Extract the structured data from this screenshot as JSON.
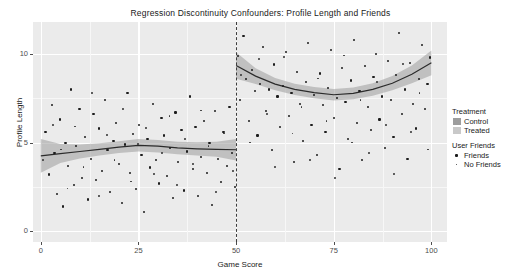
{
  "chart_data": {
    "type": "scatter",
    "title": "Regression Discontinuity Confounders: Profile Length and Friends",
    "xlabel": "Game Score",
    "ylabel": "Profile Length",
    "xlim": [
      -2,
      104
    ],
    "xticks": [
      0,
      25,
      50,
      75,
      100
    ],
    "ylim": [
      -0.6,
      11.8
    ],
    "yticks": [
      0,
      5,
      10
    ],
    "grid": true,
    "legend_position": "right",
    "cutoff": 50,
    "cutoff_style": "dashed",
    "panel_background": "#ebebeb",
    "point_color": "#1c1c1c",
    "series": [
      {
        "name": "Control",
        "ribbon_color": "#9d9d9d",
        "line_color": "#2b2b2b",
        "fit_x": [
          0,
          5,
          10,
          15,
          20,
          25,
          30,
          35,
          40,
          45,
          50
        ],
        "fit_y": [
          4.25,
          4.38,
          4.5,
          4.62,
          4.75,
          4.85,
          4.8,
          4.7,
          4.65,
          4.62,
          4.6
        ],
        "ribbon_lo": [
          3.3,
          3.85,
          4.1,
          4.28,
          4.42,
          4.5,
          4.45,
          4.35,
          4.28,
          4.2,
          4.0
        ],
        "ribbon_hi": [
          5.2,
          4.92,
          4.9,
          4.96,
          5.08,
          5.2,
          5.15,
          5.05,
          5.02,
          5.05,
          5.2
        ]
      },
      {
        "name": "Treated",
        "ribbon_color": "#9d9d9d",
        "line_color": "#2b2b2b",
        "fit_x": [
          50,
          55,
          60,
          65,
          70,
          75,
          80,
          85,
          90,
          95,
          100
        ],
        "fit_y": [
          9.35,
          8.75,
          8.3,
          8.0,
          7.82,
          7.7,
          7.78,
          8.0,
          8.35,
          8.85,
          9.5
        ],
        "ribbon_lo": [
          8.6,
          8.3,
          7.95,
          7.68,
          7.5,
          7.38,
          7.45,
          7.65,
          7.95,
          8.35,
          8.8
        ],
        "ribbon_hi": [
          10.1,
          9.2,
          8.65,
          8.32,
          8.14,
          8.02,
          8.11,
          8.35,
          8.75,
          9.35,
          10.2
        ]
      }
    ],
    "points_friends": [
      [
        1.2,
        5.6
      ],
      [
        2.1,
        3.2
      ],
      [
        2.8,
        7.1
      ],
      [
        3.5,
        4.4
      ],
      [
        4.2,
        2.1
      ],
      [
        4.9,
        6.3
      ],
      [
        5.6,
        1.4
      ],
      [
        6.3,
        5.0
      ],
      [
        7.0,
        3.7
      ],
      [
        7.8,
        8.0
      ],
      [
        8.4,
        2.6
      ],
      [
        9.1,
        4.8
      ],
      [
        9.9,
        6.9
      ],
      [
        10.6,
        3.0
      ],
      [
        11.3,
        5.3
      ],
      [
        12.0,
        1.8
      ],
      [
        12.8,
        4.1
      ],
      [
        13.5,
        6.6
      ],
      [
        14.2,
        2.9
      ],
      [
        14.9,
        5.8
      ],
      [
        15.7,
        3.4
      ],
      [
        16.4,
        7.4
      ],
      [
        17.1,
        4.6
      ],
      [
        17.8,
        2.2
      ],
      [
        18.6,
        5.1
      ],
      [
        19.3,
        6.1
      ],
      [
        20.0,
        3.8
      ],
      [
        20.7,
        1.6
      ],
      [
        21.5,
        4.9
      ],
      [
        22.2,
        7.8
      ],
      [
        22.9,
        3.3
      ],
      [
        23.6,
        5.5
      ],
      [
        24.4,
        2.4
      ],
      [
        25.1,
        6.0
      ],
      [
        25.8,
        4.3
      ],
      [
        26.5,
        1.1
      ],
      [
        27.3,
        5.2
      ],
      [
        28.0,
        3.6
      ],
      [
        28.7,
        7.2
      ],
      [
        29.4,
        4.0
      ],
      [
        30.2,
        2.7
      ],
      [
        30.9,
        6.4
      ],
      [
        31.6,
        5.4
      ],
      [
        32.3,
        3.1
      ],
      [
        33.1,
        4.7
      ],
      [
        33.8,
        1.9
      ],
      [
        34.5,
        6.7
      ],
      [
        35.2,
        3.9
      ],
      [
        36.0,
        5.7
      ],
      [
        36.7,
        2.3
      ],
      [
        37.4,
        4.5
      ],
      [
        38.1,
        7.6
      ],
      [
        38.9,
        3.5
      ],
      [
        39.6,
        5.9
      ],
      [
        40.3,
        2.0
      ],
      [
        41.0,
        4.2
      ],
      [
        41.8,
        6.2
      ],
      [
        42.5,
        3.3
      ],
      [
        43.2,
        5.0
      ],
      [
        43.9,
        1.5
      ],
      [
        44.7,
        6.8
      ],
      [
        45.4,
        4.1
      ],
      [
        46.1,
        2.8
      ],
      [
        46.8,
        5.6
      ],
      [
        47.6,
        3.7
      ],
      [
        48.3,
        7.0
      ],
      [
        49.0,
        4.4
      ],
      [
        49.7,
        2.5
      ],
      [
        50.4,
        9.9
      ],
      [
        51.1,
        7.4
      ],
      [
        51.9,
        11.0
      ],
      [
        52.6,
        8.6
      ],
      [
        53.3,
        6.2
      ],
      [
        54.0,
        9.1
      ],
      [
        54.8,
        7.9
      ],
      [
        55.5,
        5.4
      ],
      [
        56.2,
        8.3
      ],
      [
        56.9,
        10.4
      ],
      [
        57.7,
        6.8
      ],
      [
        58.4,
        8.0
      ],
      [
        59.1,
        4.6
      ],
      [
        59.8,
        9.4
      ],
      [
        60.6,
        7.6
      ],
      [
        61.3,
        5.9
      ],
      [
        62.0,
        8.2
      ],
      [
        62.7,
        10.1
      ],
      [
        63.5,
        6.5
      ],
      [
        64.2,
        7.8
      ],
      [
        64.9,
        3.9
      ],
      [
        65.6,
        9.0
      ],
      [
        66.4,
        7.2
      ],
      [
        67.1,
        5.1
      ],
      [
        67.8,
        8.4
      ],
      [
        68.5,
        10.6
      ],
      [
        69.3,
        6.0
      ],
      [
        70.0,
        7.7
      ],
      [
        70.7,
        4.3
      ],
      [
        71.4,
        8.9
      ],
      [
        72.2,
        7.1
      ],
      [
        72.9,
        5.6
      ],
      [
        73.6,
        8.1
      ],
      [
        74.3,
        10.2
      ],
      [
        75.1,
        6.4
      ],
      [
        75.8,
        7.5
      ],
      [
        76.5,
        3.5
      ],
      [
        77.2,
        9.2
      ],
      [
        78.0,
        7.3
      ],
      [
        78.7,
        5.2
      ],
      [
        79.4,
        8.5
      ],
      [
        80.1,
        10.8
      ],
      [
        80.9,
        6.1
      ],
      [
        81.6,
        7.9
      ],
      [
        82.3,
        4.0
      ],
      [
        83.0,
        9.3
      ],
      [
        83.8,
        7.0
      ],
      [
        84.5,
        5.7
      ],
      [
        85.2,
        8.7
      ],
      [
        85.9,
        10.0
      ],
      [
        86.7,
        6.3
      ],
      [
        87.4,
        7.6
      ],
      [
        88.1,
        4.7
      ],
      [
        88.8,
        9.6
      ],
      [
        89.6,
        7.4
      ],
      [
        90.3,
        5.3
      ],
      [
        91.0,
        8.8
      ],
      [
        91.7,
        11.2
      ],
      [
        92.5,
        6.6
      ],
      [
        93.2,
        8.0
      ],
      [
        93.9,
        4.1
      ],
      [
        94.6,
        9.5
      ],
      [
        95.4,
        7.2
      ],
      [
        96.1,
        5.8
      ],
      [
        96.8,
        8.6
      ],
      [
        97.5,
        10.5
      ],
      [
        98.3,
        6.9
      ],
      [
        99.0,
        8.3
      ],
      [
        99.7,
        9.8
      ]
    ],
    "points_nofriends": [
      [
        0.6,
        4.0
      ],
      [
        3.1,
        6.0
      ],
      [
        5.2,
        4.6
      ],
      [
        6.9,
        2.4
      ],
      [
        8.8,
        5.9
      ],
      [
        11.0,
        3.6
      ],
      [
        13.1,
        7.8
      ],
      [
        15.0,
        2.0
      ],
      [
        16.9,
        5.4
      ],
      [
        18.9,
        4.0
      ],
      [
        21.0,
        6.9
      ],
      [
        23.1,
        2.8
      ],
      [
        24.9,
        4.9
      ],
      [
        27.0,
        5.8
      ],
      [
        29.0,
        3.2
      ],
      [
        31.1,
        4.4
      ],
      [
        33.0,
        6.5
      ],
      [
        35.0,
        2.6
      ],
      [
        37.0,
        5.2
      ],
      [
        39.1,
        3.8
      ],
      [
        41.1,
        6.8
      ],
      [
        43.0,
        4.8
      ],
      [
        45.0,
        2.2
      ],
      [
        47.0,
        5.5
      ],
      [
        49.3,
        3.4
      ],
      [
        51.4,
        8.8
      ],
      [
        53.6,
        5.0
      ],
      [
        55.9,
        9.7
      ],
      [
        58.0,
        6.6
      ],
      [
        60.1,
        3.6
      ],
      [
        62.3,
        9.8
      ],
      [
        64.5,
        5.5
      ],
      [
        66.8,
        7.0
      ],
      [
        68.9,
        4.0
      ],
      [
        71.0,
        8.6
      ],
      [
        73.2,
        6.2
      ],
      [
        75.4,
        3.0
      ],
      [
        77.6,
        9.9
      ],
      [
        79.7,
        5.0
      ],
      [
        81.9,
        7.4
      ],
      [
        84.0,
        4.4
      ],
      [
        86.2,
        8.4
      ],
      [
        88.4,
        6.0
      ],
      [
        90.5,
        3.2
      ],
      [
        92.7,
        9.4
      ],
      [
        94.8,
        5.6
      ],
      [
        97.0,
        7.8
      ],
      [
        99.2,
        4.6
      ]
    ]
  },
  "legend": {
    "groups": [
      {
        "title": "Treatment",
        "type": "fill",
        "items": [
          {
            "label": "Control",
            "color": "#9d9d9d"
          },
          {
            "label": "Treated",
            "color": "#c9c9c9"
          }
        ]
      },
      {
        "title": "User Friends",
        "type": "point",
        "items": [
          {
            "label": "Friends",
            "color": "#1c1c1c"
          },
          {
            "label": "No Friends",
            "color": "#343434"
          }
        ]
      }
    ]
  }
}
